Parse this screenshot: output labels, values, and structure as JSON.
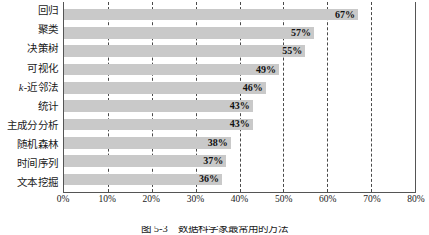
{
  "chart_data": {
    "type": "bar",
    "orientation": "horizontal",
    "title": "",
    "xlabel": "",
    "ylabel": "",
    "xlim": [
      0,
      80
    ],
    "xtick_labels": [
      "0%",
      "10%",
      "20%",
      "30%",
      "40%",
      "50%",
      "60%",
      "70%",
      "80%"
    ],
    "xticks": [
      0,
      10,
      20,
      30,
      40,
      50,
      60,
      70,
      80
    ],
    "grid": true,
    "grid_axis": "x",
    "grid_style": "dashed",
    "legend": false,
    "bar_color": "#c9c9c9",
    "categories": [
      "回归",
      "聚类",
      "决策树",
      "可视化",
      "k-近邻法",
      "统计",
      "主成分分析",
      "随机森林",
      "时间序列",
      "文本挖掘"
    ],
    "values": [
      67,
      57,
      55,
      49,
      46,
      43,
      43,
      38,
      37,
      36
    ],
    "value_labels": [
      "67%",
      "57%",
      "55%",
      "49%",
      "46%",
      "43%",
      "43%",
      "38%",
      "37%",
      "36%"
    ]
  },
  "caption": {
    "text": "图 5-3　数据科学家最常用的方法"
  }
}
